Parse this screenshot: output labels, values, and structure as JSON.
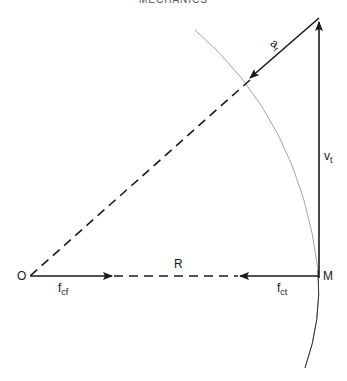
{
  "header": {
    "text": "MECHANICS"
  },
  "diagram": {
    "points": {
      "O": "O",
      "M": "M"
    },
    "labels": {
      "ar_main": "a",
      "ar_sub": "r",
      "vt_main": "v",
      "vt_sub": "t",
      "R": "R",
      "fcf_main": "f",
      "fcf_sub": "cf",
      "fct_main": "f",
      "fct_sub": "ct"
    },
    "colors": {
      "line": "#1a1a1a",
      "arc": "#9a9a9a"
    }
  }
}
